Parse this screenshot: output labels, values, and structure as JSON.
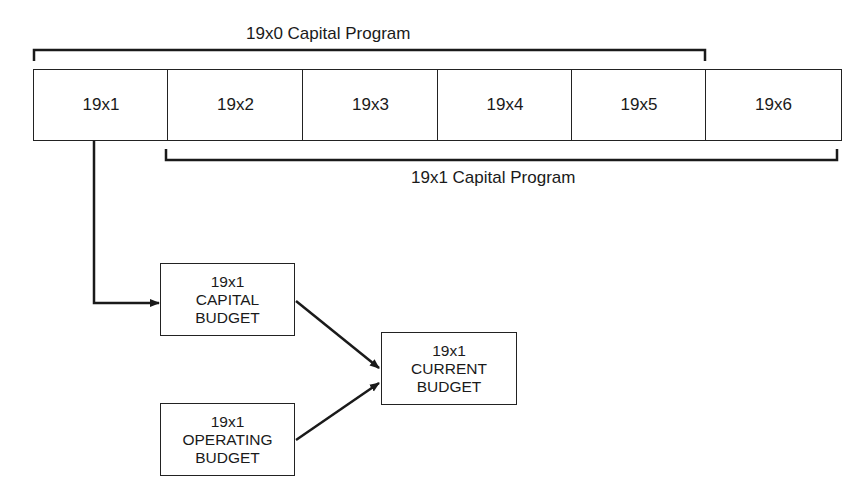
{
  "diagram": {
    "top_bracket_label": "19x0 Capital Program",
    "bottom_bracket_label": "19x1 Capital Program",
    "years": [
      "19x1",
      "19x2",
      "19x3",
      "19x4",
      "19x5",
      "19x6"
    ],
    "boxes": {
      "capital_budget": {
        "line1": "19x1",
        "line2": "CAPITAL",
        "line3": "BUDGET"
      },
      "operating_budget": {
        "line1": "19x1",
        "line2": "OPERATING",
        "line3": "BUDGET"
      },
      "current_budget": {
        "line1": "19x1",
        "line2": "CURRENT",
        "line3": "BUDGET"
      }
    },
    "edges": [
      {
        "from": "19x1",
        "to": "capital_budget"
      },
      {
        "from": "capital_budget",
        "to": "current_budget"
      },
      {
        "from": "operating_budget",
        "to": "current_budget"
      }
    ],
    "line_color": "#1a1a1a"
  }
}
